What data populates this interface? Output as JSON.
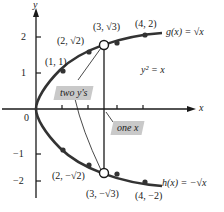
{
  "axes": {
    "x_label": "x",
    "y_label": "y",
    "origin_label": "0",
    "y_ticks": [
      {
        "value": 2,
        "label": "2"
      },
      {
        "value": 1,
        "label": "1"
      },
      {
        "value": -1,
        "label": "−1"
      },
      {
        "value": -2,
        "label": "−2"
      }
    ],
    "x_ticks": [
      1,
      2,
      3,
      4
    ]
  },
  "equation": "y² = x",
  "curves": {
    "upper": {
      "name": "g",
      "label": "g(x) = √x"
    },
    "lower": {
      "name": "h",
      "label": "h(x) = −√x"
    }
  },
  "points": {
    "p_1_1": "(1, 1)",
    "p_2_r2": "(2, √2)",
    "p_3_r3": "(3, √3)",
    "p_4_2": "(4, 2)",
    "p_1_m1": "(1, −1)",
    "p_2_mr2": "(2, −√2)",
    "p_3_mr3": "(3, −√3)",
    "p_4_m2": "(4, −2)"
  },
  "callouts": {
    "two_ys": "two y's",
    "one_x": "one x"
  },
  "colors": {
    "curve": "#333333",
    "axis": "#1a1a1a",
    "callout_bg": "#c9c9c9"
  }
}
